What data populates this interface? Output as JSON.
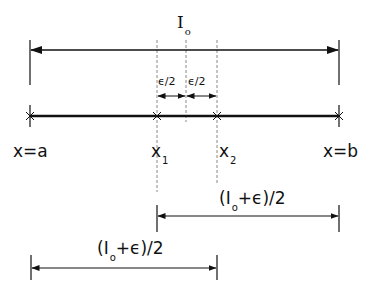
{
  "diagram": {
    "total_interval_label": {
      "main": "I",
      "sub": "o"
    },
    "epsilon_half_left": "ϵ/2",
    "epsilon_half_right": "ϵ/2",
    "points": {
      "a": "x=a",
      "x1": {
        "main": "x",
        "sub": "1"
      },
      "x2": {
        "main": "x",
        "sub": "2"
      },
      "b": "x=b"
    },
    "right_half_label": {
      "open": "(I",
      "sub": "o",
      "rest": "+ϵ)/2"
    },
    "left_half_label": {
      "open": "(I",
      "sub": "o",
      "rest": "+ϵ)/2"
    },
    "colors": {
      "line": "#111111",
      "dashed": "#888888"
    }
  }
}
